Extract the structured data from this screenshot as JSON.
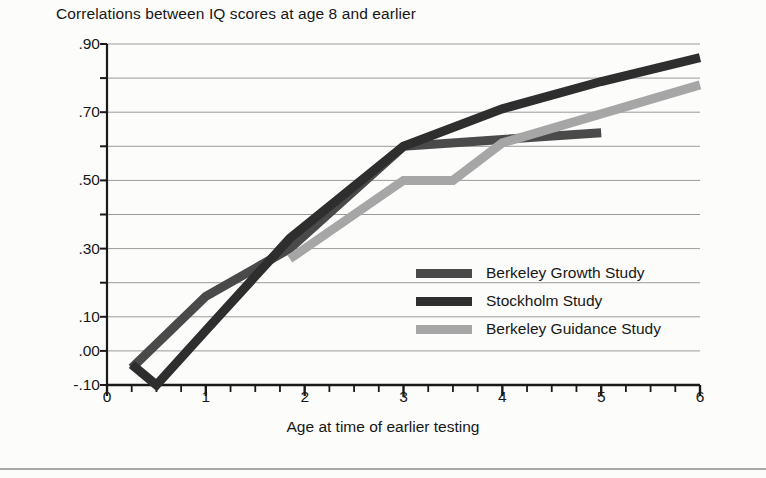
{
  "figure": {
    "title": "Correlations between IQ scores at age 8 and earlier",
    "background_color": "#fcfcfb",
    "rule_color": "#a9a9a9"
  },
  "chart_data": {
    "type": "line",
    "title": "Correlations between IQ scores at age 8 and earlier",
    "xlabel": "Age at time of earlier testing",
    "ylabel": "",
    "xlim": [
      0,
      6
    ],
    "ylim": [
      -0.1,
      0.9
    ],
    "grid": true,
    "grid_axis": "y",
    "legend_position": "center-right",
    "x_ticks": [
      0,
      1,
      2,
      3,
      4,
      5,
      6
    ],
    "x_tick_labels": [
      "0",
      "1",
      "2",
      "3",
      "4",
      "5",
      "6"
    ],
    "x_minor_tick_step": 0.25,
    "y_ticks": [
      -0.1,
      0.0,
      0.1,
      0.2,
      0.3,
      0.4,
      0.5,
      0.6,
      0.7,
      0.8,
      0.9
    ],
    "y_tick_labels_shown": [
      {
        "value": 0.9,
        "label": ".90"
      },
      {
        "value": 0.7,
        "label": ".70"
      },
      {
        "value": 0.5,
        "label": ".50"
      },
      {
        "value": 0.3,
        "label": ".30"
      },
      {
        "value": 0.1,
        "label": ".10"
      },
      {
        "value": 0.0,
        "label": ".00"
      },
      {
        "value": -0.1,
        "label": "-.10"
      }
    ],
    "series": [
      {
        "name": "Berkeley Growth Study",
        "color": "#4a4a4a",
        "line_width": 9,
        "points": [
          {
            "x": 0.25,
            "y": -0.05
          },
          {
            "x": 1.0,
            "y": 0.16
          },
          {
            "x": 1.85,
            "y": 0.3
          },
          {
            "x": 3.0,
            "y": 0.6
          },
          {
            "x": 4.0,
            "y": 0.62
          },
          {
            "x": 5.0,
            "y": 0.64
          }
        ]
      },
      {
        "name": "Stockholm Study",
        "color": "#2e2e2e",
        "line_width": 9,
        "points": [
          {
            "x": 0.25,
            "y": -0.04
          },
          {
            "x": 0.5,
            "y": -0.1
          },
          {
            "x": 1.0,
            "y": 0.06
          },
          {
            "x": 1.85,
            "y": 0.33
          },
          {
            "x": 3.0,
            "y": 0.6
          },
          {
            "x": 4.0,
            "y": 0.71
          },
          {
            "x": 5.0,
            "y": 0.79
          },
          {
            "x": 6.0,
            "y": 0.86
          }
        ]
      },
      {
        "name": "Berkeley Guidance Study",
        "color": "#a6a6a6",
        "line_width": 9,
        "points": [
          {
            "x": 1.85,
            "y": 0.27
          },
          {
            "x": 3.0,
            "y": 0.5
          },
          {
            "x": 3.5,
            "y": 0.5
          },
          {
            "x": 4.0,
            "y": 0.61
          },
          {
            "x": 6.0,
            "y": 0.78
          }
        ]
      }
    ]
  },
  "legend": {
    "items": [
      {
        "label": "Berkeley Growth Study",
        "color": "#4a4a4a"
      },
      {
        "label": "Stockholm Study",
        "color": "#2e2e2e"
      },
      {
        "label": "Berkeley Guidance Study",
        "color": "#a6a6a6"
      }
    ]
  }
}
